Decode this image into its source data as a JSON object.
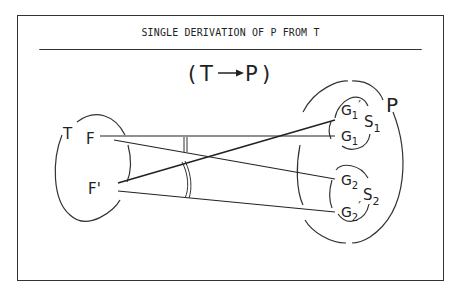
{
  "title": "SINGLE DERIVATION OF P FROM T",
  "subtitle": "(T—▸P)",
  "subtitle_parts": {
    "open": "(",
    "from": "T",
    "to": "P",
    "close": ")"
  },
  "source_set": {
    "label": "T",
    "elements": [
      "F",
      "F'"
    ]
  },
  "target_set": {
    "label": "P",
    "subsets": [
      {
        "label": "S1",
        "elements": [
          "G1'",
          "G1"
        ]
      },
      {
        "label": "S2",
        "elements": [
          "G2",
          "G2'"
        ]
      }
    ]
  },
  "mappings": [
    {
      "from": "F",
      "to": "G1"
    },
    {
      "from": "F",
      "to": "G2"
    },
    {
      "from": "F'",
      "to": "G1'"
    },
    {
      "from": "F'",
      "to": "G2'"
    }
  ],
  "colors": {
    "ink": "#222222",
    "background": "#ffffff"
  }
}
